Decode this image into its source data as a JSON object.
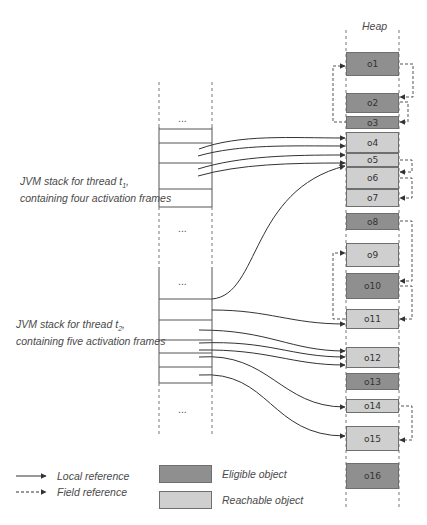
{
  "heap": {
    "title": "Heap",
    "objects": [
      {
        "id": "o1",
        "label": "o1",
        "kind": "eligible",
        "top": 52,
        "height": 24
      },
      {
        "id": "o2",
        "label": "o2",
        "kind": "eligible",
        "top": 93,
        "height": 20
      },
      {
        "id": "o3",
        "label": "o3",
        "kind": "eligible",
        "top": 116,
        "height": 13
      },
      {
        "id": "o4",
        "label": "o4",
        "kind": "reachable",
        "top": 132,
        "height": 21
      },
      {
        "id": "o5",
        "label": "o5",
        "kind": "reachable",
        "top": 153,
        "height": 14
      },
      {
        "id": "o6",
        "label": "o6",
        "kind": "reachable",
        "top": 167,
        "height": 22
      },
      {
        "id": "o7",
        "label": "o7",
        "kind": "reachable",
        "top": 189,
        "height": 18
      },
      {
        "id": "o8",
        "label": "o8",
        "kind": "eligible",
        "top": 213,
        "height": 17
      },
      {
        "id": "o9",
        "label": "o9",
        "kind": "reachable",
        "top": 243,
        "height": 24
      },
      {
        "id": "o10",
        "label": "o10",
        "kind": "eligible",
        "top": 273,
        "height": 26
      },
      {
        "id": "o11",
        "label": "o11",
        "kind": "reachable",
        "top": 309,
        "height": 20
      },
      {
        "id": "o12",
        "label": "o12",
        "kind": "reachable",
        "top": 347,
        "height": 21
      },
      {
        "id": "o13",
        "label": "o13",
        "kind": "eligible",
        "top": 373,
        "height": 17
      },
      {
        "id": "o14",
        "label": "o14",
        "kind": "reachable",
        "top": 399,
        "height": 14
      },
      {
        "id": "o15",
        "label": "o15",
        "kind": "reachable",
        "top": 426,
        "height": 25
      },
      {
        "id": "o16",
        "label": "o16",
        "kind": "eligible",
        "top": 463,
        "height": 26
      }
    ]
  },
  "stacks": [
    {
      "id": "t1",
      "label_line1": "JVM stack for thread t",
      "subscript": "1",
      "label_suffix": ",",
      "label_line2": "containing four activation frames",
      "ellipsis_top": "...",
      "ellipsis_bottom": "..."
    },
    {
      "id": "t2",
      "label_line1": "JVM stack for thread t",
      "subscript": "2",
      "label_suffix": ",",
      "label_line2": "containing five activation frames",
      "ellipsis_top": "...",
      "ellipsis_bottom": "..."
    }
  ],
  "references": {
    "local": [
      {
        "from_y": 160,
        "to": "o4",
        "to_y": 138
      },
      {
        "from_y": 166,
        "to": "o4",
        "to_y": 146
      },
      {
        "from_y": 177,
        "to": "o5",
        "to_y": 155
      },
      {
        "from_y": 183,
        "to": "o5",
        "to_y": 163
      },
      {
        "from_y": 299,
        "to": "o5",
        "to_y": 166
      },
      {
        "from_y": 310,
        "to": "o11",
        "to_y": 324
      },
      {
        "from_y": 330,
        "to": "o12",
        "to_y": 351
      },
      {
        "from_y": 340,
        "to": "o12",
        "to_y": 357
      },
      {
        "from_y": 349,
        "to": "o12",
        "to_y": 365
      },
      {
        "from_y": 357,
        "to": "o14",
        "to_y": 407
      },
      {
        "from_y": 375,
        "to": "o15",
        "to_y": 436
      }
    ],
    "field": [
      {
        "from": "o1",
        "to": "o2"
      },
      {
        "from": "o2",
        "to": "o3"
      },
      {
        "from": "o3",
        "to": "o1"
      },
      {
        "from": "o5",
        "to": "o6"
      },
      {
        "from": "o6",
        "to": "o7"
      },
      {
        "from": "o8",
        "to": "o10"
      },
      {
        "from": "o10",
        "to": "o11"
      },
      {
        "from": "o11",
        "to": "o9"
      },
      {
        "from": "o14",
        "to": "o15"
      }
    ]
  },
  "legend": {
    "local_reference": "Local reference",
    "field_reference": "Field reference",
    "eligible_object": "Eligible object",
    "reachable_object": "Reachable object",
    "colors": {
      "eligible": "#8f8f8f",
      "reachable": "#cfcfcf"
    }
  }
}
